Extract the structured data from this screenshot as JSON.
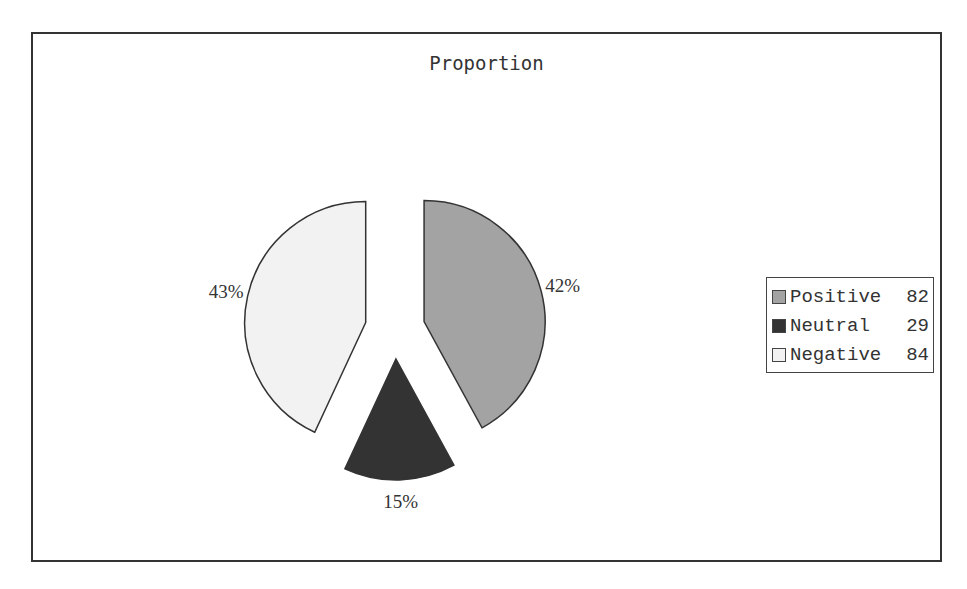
{
  "chart_data": {
    "type": "pie",
    "title": "Proportion",
    "categories": [
      "Positive",
      "Neutral",
      "Negative"
    ],
    "values": [
      82,
      29,
      84
    ],
    "percent_labels": [
      "42%",
      "15%",
      "43%"
    ],
    "colors": [
      "#a3a3a3",
      "#333333",
      "#f2f2f2"
    ],
    "exploded": true,
    "legend_position": "right",
    "legend": [
      {
        "label": "Positive",
        "value": "82"
      },
      {
        "label": "Neutral",
        "value": "29"
      },
      {
        "label": "Negative",
        "value": "84"
      }
    ]
  }
}
